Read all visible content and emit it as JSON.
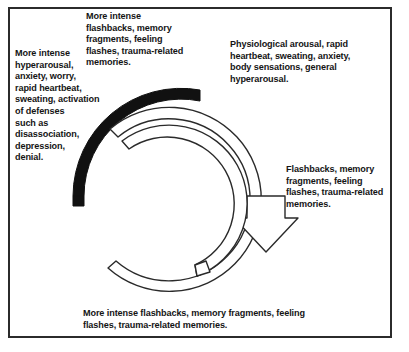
{
  "diagram": {
    "title_text_blocks": {
      "top": "More intense\nflashbacks, memory\nfragments, feeling\nflashes, trauma-related\nmemories.",
      "left": "More intense\nhyperarousal,\nanxiety, worry,\nrapid heartbeat,\nsweating, activation\nof defenses\nsuch as\ndisassociation,\ndepression,\ndenial.",
      "right_top": "Physiological arousal, rapid\nheartbeat, sweating, anxiety,\nbody sensations, general\nhyperarousal.",
      "right_mid": "Flashbacks, memory\nfragments, feeling\nflashes, trauma-related\nmemories.",
      "bottom": "More intense flashbacks, memory fragments, feeling\nflashes, trauma-related memories."
    },
    "colors": {
      "frame_border": "#2b2b2b",
      "solid_arc": "#111111",
      "spiral_stroke": "#2a2a2a",
      "spiral_fill": "#ffffff",
      "text": "#141414",
      "background": "#ffffff"
    }
  }
}
